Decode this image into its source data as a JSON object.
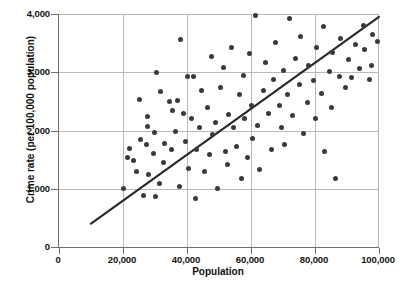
{
  "chart_data": {
    "type": "scatter",
    "title": "",
    "xlabel": "Population",
    "ylabel": "Crime rate (per 100,000 population)",
    "xlim": [
      0,
      100000
    ],
    "ylim": [
      0,
      4000
    ],
    "xticks": [
      0,
      20000,
      40000,
      60000,
      80000,
      100000
    ],
    "xtick_labels": [
      "0",
      "20,000",
      "40,000",
      "60,000",
      "80,000",
      "100,000"
    ],
    "yticks": [
      0,
      1000,
      2000,
      3000,
      4000
    ],
    "ytick_labels": [
      "0",
      "1,000",
      "2,000",
      "3,000",
      "4,000"
    ],
    "grid": true,
    "legend": null,
    "marker_color": "#3a3a3a",
    "trendline_color": "#2b2b2b",
    "axis_color": "#6e6e6e",
    "grid_color": "#b9b9b9",
    "points": [
      [
        20300,
        1000
      ],
      [
        21300,
        1530
      ],
      [
        22100,
        1690
      ],
      [
        23300,
        1480
      ],
      [
        24300,
        1290
      ],
      [
        25000,
        2530
      ],
      [
        25600,
        1840
      ],
      [
        26300,
        880
      ],
      [
        27200,
        1760
      ],
      [
        27500,
        2240
      ],
      [
        27800,
        2070
      ],
      [
        28100,
        1240
      ],
      [
        29400,
        1610
      ],
      [
        29700,
        1960
      ],
      [
        30300,
        870
      ],
      [
        30600,
        2990
      ],
      [
        31300,
        1090
      ],
      [
        31600,
        2670
      ],
      [
        32500,
        1450
      ],
      [
        33100,
        1780
      ],
      [
        34400,
        2500
      ],
      [
        35000,
        1670
      ],
      [
        35600,
        2340
      ],
      [
        36300,
        1980
      ],
      [
        36900,
        2520
      ],
      [
        37500,
        1040
      ],
      [
        38100,
        3560
      ],
      [
        38800,
        2290
      ],
      [
        39400,
        1810
      ],
      [
        40000,
        2930
      ],
      [
        40600,
        1350
      ],
      [
        41300,
        2200
      ],
      [
        41900,
        2930
      ],
      [
        42500,
        840
      ],
      [
        43100,
        1680
      ],
      [
        43800,
        2050
      ],
      [
        44400,
        2690
      ],
      [
        45600,
        1290
      ],
      [
        46300,
        2400
      ],
      [
        46900,
        1590
      ],
      [
        47500,
        3270
      ],
      [
        48100,
        1930
      ],
      [
        48800,
        2130
      ],
      [
        49400,
        1010
      ],
      [
        50600,
        2740
      ],
      [
        51300,
        3090
      ],
      [
        51900,
        1640
      ],
      [
        52500,
        1420
      ],
      [
        53100,
        2280
      ],
      [
        53800,
        3420
      ],
      [
        54400,
        2050
      ],
      [
        55600,
        1720
      ],
      [
        56300,
        2610
      ],
      [
        56900,
        1180
      ],
      [
        57500,
        2940
      ],
      [
        58100,
        2210
      ],
      [
        58800,
        1540
      ],
      [
        59400,
        3320
      ],
      [
        60000,
        2430
      ],
      [
        60600,
        1870
      ],
      [
        61300,
        3970
      ],
      [
        61900,
        2080
      ],
      [
        62500,
        1330
      ],
      [
        63800,
        2690
      ],
      [
        64400,
        3160
      ],
      [
        65600,
        2290
      ],
      [
        66300,
        1680
      ],
      [
        66900,
        2880
      ],
      [
        67500,
        3510
      ],
      [
        68800,
        2430
      ],
      [
        69400,
        2060
      ],
      [
        70000,
        3030
      ],
      [
        70600,
        1760
      ],
      [
        71300,
        2620
      ],
      [
        71900,
        3930
      ],
      [
        73100,
        2250
      ],
      [
        73800,
        3240
      ],
      [
        75000,
        2790
      ],
      [
        75600,
        3620
      ],
      [
        76300,
        1940
      ],
      [
        77500,
        2480
      ],
      [
        78100,
        3110
      ],
      [
        79400,
        2860
      ],
      [
        80000,
        2210
      ],
      [
        80600,
        3430
      ],
      [
        81900,
        2640
      ],
      [
        82500,
        3790
      ],
      [
        83100,
        1640
      ],
      [
        84400,
        3020
      ],
      [
        85000,
        2390
      ],
      [
        85600,
        3340
      ],
      [
        86300,
        1180
      ],
      [
        87500,
        2930
      ],
      [
        88100,
        3580
      ],
      [
        89400,
        2740
      ],
      [
        90600,
        3220
      ],
      [
        91300,
        2910
      ],
      [
        92500,
        3470
      ],
      [
        93800,
        3060
      ],
      [
        95000,
        3800
      ],
      [
        95600,
        3390
      ],
      [
        96900,
        2870
      ],
      [
        98100,
        3640
      ],
      [
        99400,
        3520
      ],
      [
        97500,
        3110
      ]
    ],
    "trendline": {
      "x_start": 10000,
      "y_start": 400,
      "x_end": 100000,
      "y_end": 3950
    }
  }
}
